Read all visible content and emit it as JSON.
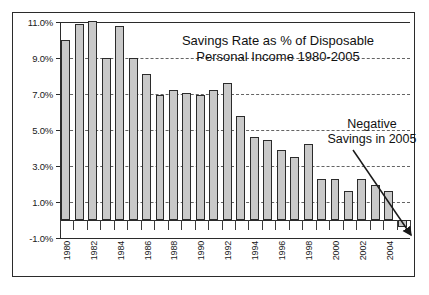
{
  "chart_data": {
    "type": "bar",
    "title": "Savings Rate as % of Disposable Personal Income 1980-2005",
    "title_line1": "Savings Rate as % of Disposable",
    "title_line2": "Personal Income 1980-2005",
    "xlabel": "",
    "ylabel": "",
    "ylim": [
      -1.0,
      11.0
    ],
    "grid": true,
    "legend": "none",
    "categories": [
      1980,
      1981,
      1982,
      1983,
      1984,
      1985,
      1986,
      1987,
      1988,
      1989,
      1990,
      1991,
      1992,
      1993,
      1994,
      1995,
      1996,
      1997,
      1998,
      1999,
      2000,
      2001,
      2002,
      2003,
      2004,
      2005
    ],
    "values": [
      10.0,
      10.9,
      11.05,
      9.0,
      10.8,
      9.0,
      8.1,
      6.95,
      7.2,
      7.05,
      6.95,
      7.2,
      7.6,
      5.8,
      4.6,
      4.45,
      3.9,
      3.5,
      4.2,
      2.3,
      2.3,
      1.6,
      2.3,
      1.95,
      1.6,
      -0.4
    ],
    "ytick_labels": [
      "11.0%",
      "9.0%",
      "7.0%",
      "5.0%",
      "3.0%",
      "1.0%",
      "-1.0%"
    ],
    "ytick_values": [
      11.0,
      9.0,
      7.0,
      5.0,
      3.0,
      1.0,
      -1.0
    ],
    "xtick_labels": [
      "1980",
      "1982",
      "1984",
      "1986",
      "1988",
      "1990",
      "1992",
      "1994",
      "1996",
      "1998",
      "2000",
      "2002",
      "2004"
    ],
    "xtick_values": [
      1980,
      1982,
      1984,
      1986,
      1988,
      1990,
      1992,
      1994,
      1996,
      1998,
      2000,
      2002,
      2004
    ],
    "annotations": [
      {
        "text": "Negative Savings in 2005",
        "line1": "Negative",
        "line2": "Savings in 2005",
        "points_to_year": 2005,
        "points_to_value": -0.4
      }
    ],
    "colors": {
      "bar_fill": "#c9c9c9",
      "bar_stroke": "#2b2b2b",
      "grid": "#4a4a4a",
      "axis": "#2b2b2b",
      "text": "#111111",
      "background": "#ffffff"
    }
  }
}
